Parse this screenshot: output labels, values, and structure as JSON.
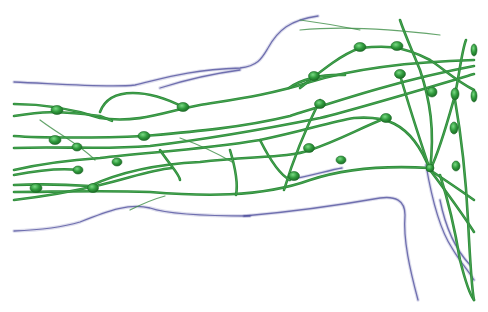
{
  "illustration": {
    "subject": "lymphatic system of the arm",
    "colors": {
      "background": "#ffffff",
      "outline": "#4a4a9a",
      "vessel": "#2e8b3a",
      "vessel_thin": "#3f8f47",
      "node": "#2f9a3c",
      "node_highlight": "#6fd07a"
    },
    "outlines": [
      "M14 82 C60 84 110 88 135 85 C165 78 190 70 240 68 C258 66 262 58 268 48 C278 30 290 20 318 16",
      "M160 88 C185 80 210 74 240 70",
      "M14 231 C40 230 60 228 80 222 C110 210 130 203 150 208 C170 215 210 216 250 216",
      "M244 216 C290 212 340 205 380 198 C395 196 405 200 405 215 C403 240 410 270 418 300",
      "M288 180 C310 176 330 170 342 168",
      "M426 165 C432 200 440 230 452 248 C460 262 468 270 474 280",
      "M440 200 C446 230 456 250 470 265"
    ],
    "vessels": [
      "M14 104 C40 104 70 108 100 118 C140 124 170 110 200 105 C230 100 270 95 310 82 C350 70 400 62 474 60",
      "M14 116 C40 112 56 110 100 116 C110 120 115 122 110 120",
      "M100 112 C110 85 150 90 183 107",
      "M14 136 C40 138 100 138 144 136 C190 132 240 128 290 116 C340 100 400 80 474 66",
      "M14 148 C60 146 100 150 150 146 C200 140 260 130 320 118 C360 108 420 90 474 74",
      "M14 170 C40 164 70 160 100 158 C150 152 200 150 260 140 C300 132 330 122 354 118 C380 116 410 118 430 170",
      "M14 185 C35 184 60 184 90 186 C120 172 160 164 200 162 C250 156 290 158 310 150 C340 140 360 128 386 118",
      "M14 192 C50 192 100 190 150 192 C200 196 260 198 310 180 C340 170 380 165 430 168",
      "M14 200 C40 197 70 192 100 185 C130 178 150 170 172 168",
      "M14 175 C40 170 60 168 78 170",
      "M360 48 C380 46 400 44 430 60 C445 70 455 80 474 90",
      "M300 88 C320 72 340 55 360 48",
      "M289 88 C300 80 320 74 345 75",
      "M430 170 C440 150 448 120 455 95 C460 70 462 50 466 40",
      "M430 170 C445 180 460 190 474 200",
      "M430 170 C445 190 460 210 474 232",
      "M430 170 C420 140 410 110 400 75",
      "M430 170 C435 130 430 100 420 70 C412 50 405 35 400 20",
      "M440 175 C448 200 455 230 460 260 C465 280 470 295 474 300",
      "M455 100 C462 140 466 180 468 220 C470 260 472 290 474 300",
      "M320 100 C300 140 290 170 284 190",
      "M230 150 C236 170 238 185 236 195",
      "M160 150 C170 165 180 175 180 180",
      "M260 140 C270 160 280 175 290 180"
    ],
    "thin_vessels": [
      "M300 30 C350 25 400 30 440 35",
      "M300 20 C330 24 350 28 360 30",
      "M180 138 C200 145 215 152 232 162",
      "M130 210 C140 205 150 200 165 196",
      "M40 120 C60 135 80 145 95 160"
    ],
    "nodes": [
      {
        "cx": 57,
        "cy": 110,
        "rx": 6,
        "ry": 4.5
      },
      {
        "cx": 183,
        "cy": 107,
        "rx": 6,
        "ry": 4.5
      },
      {
        "cx": 55,
        "cy": 140,
        "rx": 6,
        "ry": 4.5
      },
      {
        "cx": 77,
        "cy": 147,
        "rx": 5,
        "ry": 4
      },
      {
        "cx": 144,
        "cy": 136,
        "rx": 6,
        "ry": 4.5
      },
      {
        "cx": 360,
        "cy": 47,
        "rx": 6,
        "ry": 4.5
      },
      {
        "cx": 397,
        "cy": 46,
        "rx": 6,
        "ry": 4.5
      },
      {
        "cx": 314,
        "cy": 76,
        "rx": 5.5,
        "ry": 4.5
      },
      {
        "cx": 400,
        "cy": 74,
        "rx": 5.5,
        "ry": 4.5
      },
      {
        "cx": 320,
        "cy": 104,
        "rx": 5.5,
        "ry": 4.5
      },
      {
        "cx": 432,
        "cy": 92,
        "rx": 5,
        "ry": 5
      },
      {
        "cx": 455,
        "cy": 94,
        "rx": 4,
        "ry": 6
      },
      {
        "cx": 474,
        "cy": 50,
        "rx": 3,
        "ry": 6
      },
      {
        "cx": 474,
        "cy": 96,
        "rx": 3,
        "ry": 6
      },
      {
        "cx": 386,
        "cy": 118,
        "rx": 5.5,
        "ry": 4.5
      },
      {
        "cx": 454,
        "cy": 128,
        "rx": 4,
        "ry": 6
      },
      {
        "cx": 309,
        "cy": 148,
        "rx": 5.5,
        "ry": 4.5
      },
      {
        "cx": 341,
        "cy": 160,
        "rx": 5,
        "ry": 4
      },
      {
        "cx": 117,
        "cy": 162,
        "rx": 5,
        "ry": 4
      },
      {
        "cx": 78,
        "cy": 170,
        "rx": 5,
        "ry": 4
      },
      {
        "cx": 36,
        "cy": 188,
        "rx": 6,
        "ry": 4.5
      },
      {
        "cx": 93,
        "cy": 188,
        "rx": 5.5,
        "ry": 4.5
      },
      {
        "cx": 294,
        "cy": 176,
        "rx": 5.5,
        "ry": 4.5
      },
      {
        "cx": 430,
        "cy": 168,
        "rx": 4,
        "ry": 4
      },
      {
        "cx": 456,
        "cy": 166,
        "rx": 4,
        "ry": 5
      }
    ]
  }
}
